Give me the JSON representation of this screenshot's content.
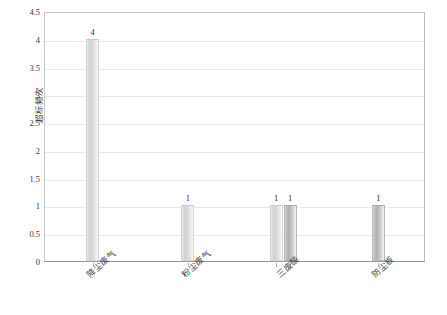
{
  "chart_data": {
    "type": "bar",
    "title": "",
    "xlabel": "",
    "ylabel": "超标频次",
    "ylim": [
      0,
      4.5
    ],
    "ytick_labels": [
      "0",
      "0.5",
      "1",
      "1.5",
      "2",
      "2.5",
      "3",
      "3.5",
      "4",
      "4.5"
    ],
    "ytick_values": [
      0,
      0.5,
      1,
      1.5,
      2,
      2.5,
      3,
      3.5,
      4,
      4.5
    ],
    "grid": true,
    "grid_axis": "y",
    "legend": "none",
    "categories": [
      "降尘废气",
      "粉尘废气",
      "三废酸",
      "防尘板"
    ],
    "bars": [
      {
        "category_index": 0,
        "label": "4",
        "value": 4,
        "series": "series-a"
      },
      {
        "category_index": 1,
        "label": "1",
        "value": 1,
        "series": "series-a"
      },
      {
        "category_index": 2,
        "label": "1",
        "value": 1,
        "series": "series-a"
      },
      {
        "category_index": 2,
        "label": "1",
        "value": 1,
        "series": "series-b"
      },
      {
        "category_index": 3,
        "label": "1",
        "value": 1,
        "series": "series-b"
      }
    ],
    "series": [
      {
        "name": "series-a",
        "color": "#d2d2d2"
      },
      {
        "name": "series-b",
        "color": "#b0b0b0"
      }
    ],
    "colors": {
      "plot_border": "#c8c8c8",
      "gridline": "#e9e9e9",
      "axis_text": "#3a3a3a",
      "background": "#ffffff"
    }
  }
}
